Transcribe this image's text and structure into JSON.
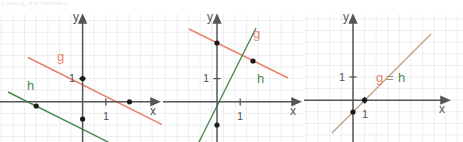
{
  "figure": {
    "title_fragment": "Lösung, die Geraden",
    "background": "#ffffff",
    "grid_color": "#eceef2",
    "axis_color": "#565656",
    "point_color": "#1a1a1a",
    "colors": {
      "g": "#e8836a",
      "h": "#4a8a4e",
      "gh_combined": "#bfa58c"
    }
  },
  "panels": [
    {
      "id": "panel-1",
      "axis": {
        "x_label": "x",
        "y_label": "y",
        "x_tick_label": "1",
        "y_tick_label": "1"
      },
      "lines": [
        {
          "name": "g",
          "label": "g",
          "color": "#e8836a",
          "slope": -0.5,
          "intercept": 1,
          "points": [
            {
              "x": 0,
              "y": 1
            },
            {
              "x": 2,
              "y": 0
            }
          ]
        },
        {
          "name": "h",
          "label": "h",
          "color": "#4a8a4e",
          "slope": -0.5,
          "intercept": -0.75,
          "points": [
            {
              "x": -1.5,
              "y": 0
            },
            {
              "x": 0,
              "y": -0.75
            }
          ]
        }
      ]
    },
    {
      "id": "panel-2",
      "axis": {
        "x_label": "x",
        "y_label": "y",
        "x_tick_label": "1",
        "y_tick_label": "1"
      },
      "lines": [
        {
          "name": "g",
          "label": "g",
          "color": "#e8836a",
          "slope": -0.5,
          "intercept": 3,
          "points": [
            {
              "x": 0,
              "y": 3
            },
            {
              "x": 2,
              "y": 2
            }
          ]
        },
        {
          "name": "h",
          "label": "h",
          "color": "#4a8a4e",
          "slope": 2,
          "intercept": -2,
          "points": [
            {
              "x": 0,
              "y": -2
            },
            {
              "x": 2,
              "y": 2
            }
          ]
        }
      ]
    },
    {
      "id": "panel-3",
      "axis": {
        "x_label": "x",
        "y_label": "y",
        "x_tick_label": "1",
        "y_tick_label": "1"
      },
      "lines": [
        {
          "name": "g=h",
          "label_g": "g",
          "label_eq": "=",
          "label_h": "h",
          "color": "#bfa58c",
          "slope": 1,
          "intercept": -1,
          "points": [
            {
              "x": 0,
              "y": -1
            },
            {
              "x": 1,
              "y": 0
            }
          ]
        }
      ]
    }
  ]
}
